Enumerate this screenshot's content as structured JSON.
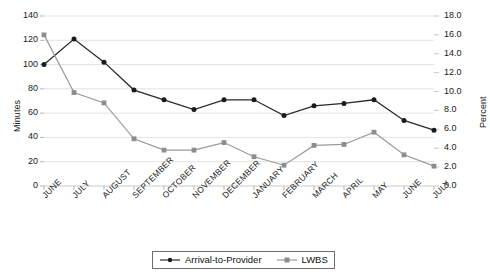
{
  "chart_data": {
    "type": "line",
    "title": "",
    "xlabel": "",
    "ylabel": "Minutes",
    "y2label": "Percent",
    "grid": true,
    "legend_position": "bottom",
    "categories": [
      "JUNE",
      "JULY",
      "AUGUST",
      "SEPTEMBER",
      "OCTOBER",
      "NOVEMBER",
      "DECEMBER",
      "JANUARY",
      "FEBRUARY",
      "MARCH",
      "APRIL",
      "MAY",
      "JUNE",
      "JULY"
    ],
    "ylim": [
      0,
      140
    ],
    "yticks": [
      "0",
      "20",
      "40",
      "60",
      "80",
      "100",
      "120",
      "140"
    ],
    "y2lim": [
      0,
      18
    ],
    "y2ticks": [
      "0.0",
      "2.0",
      "4.0",
      "6.0",
      "8.0",
      "10.0",
      "12.0",
      "14.0",
      "16.0",
      "18.0"
    ],
    "series": [
      {
        "name": "Arrival-to-Provider",
        "axis": "left",
        "unit": "minutes",
        "color": "#2b2b2b",
        "marker": "circle",
        "values": [
          100,
          121,
          102,
          79,
          71,
          63,
          71,
          71,
          58,
          66,
          68,
          71,
          54,
          46
        ]
      },
      {
        "name": "LWBS",
        "axis": "right",
        "unit": "percent",
        "color": "#9a9a9a",
        "marker": "square",
        "values": [
          16.0,
          9.9,
          8.8,
          5.0,
          3.8,
          3.8,
          4.6,
          3.1,
          2.2,
          4.3,
          4.4,
          5.7,
          3.3,
          2.1
        ]
      }
    ]
  },
  "legend": {
    "items": [
      {
        "label": "Arrival-to-Provider"
      },
      {
        "label": "LWBS"
      }
    ]
  }
}
